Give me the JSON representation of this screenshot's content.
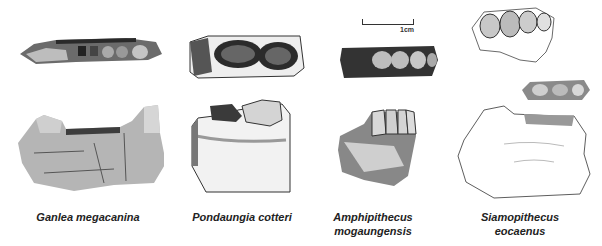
{
  "figure": {
    "scale_bar_label": "1cm",
    "specimens": [
      {
        "name": "Ganlea megacanina",
        "label_line1": "Ganlea megacanina",
        "label_line2": ""
      },
      {
        "name": "Pondaungia cotteri",
        "label_line1": "Pondaungia cotteri",
        "label_line2": ""
      },
      {
        "name": "Amphipithecus mogaungensis",
        "label_line1": "Amphipithecus",
        "label_line2": "mogaungensis"
      },
      {
        "name": "Siamopithecus eocaenus",
        "label_line1": "Siamopithecus",
        "label_line2": "eocaenus"
      }
    ]
  }
}
